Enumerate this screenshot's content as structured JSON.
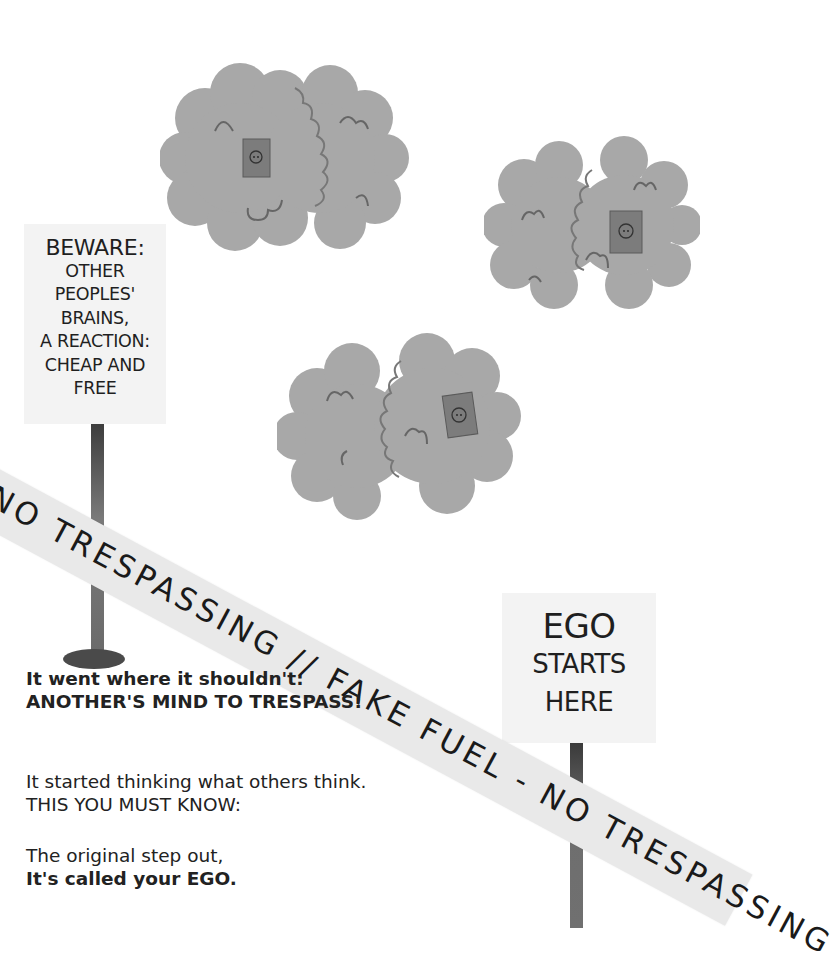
{
  "signs": {
    "left": {
      "lines": [
        "BEWARE:",
        "OTHER",
        "PEOPLES'",
        "BRAINS,",
        "A REACTION:",
        "CHEAP AND",
        "FREE"
      ]
    },
    "right": {
      "lines": [
        "EGO",
        "STARTS",
        "HERE"
      ]
    }
  },
  "tape": {
    "text": "NO TRESPASSING // FAKE FUEL - NO TRESPASSING"
  },
  "poem": {
    "stanza1": {
      "line1": "It went where it shouldn't:",
      "line2": "ANOTHER'S MIND TO TRESPASS!"
    },
    "stanza2": {
      "line1": "It started thinking what others think.",
      "line2": "THIS YOU MUST KNOW:"
    },
    "stanza3": {
      "line1": "The original step out,",
      "line2": "It's called your EGO."
    }
  },
  "illustration": {
    "brains": [
      {
        "name": "brain-top-left",
        "has_outlet": true
      },
      {
        "name": "brain-top-right",
        "has_outlet": true
      },
      {
        "name": "brain-center",
        "has_outlet": true
      }
    ],
    "colors": {
      "brain_fill": "#a9a9a9",
      "outlet_fill": "#7c7c7c",
      "sign_bg": "#f3f3f3",
      "tape_bg": "#e9e9e9",
      "pole": "#6e6e6e"
    }
  }
}
